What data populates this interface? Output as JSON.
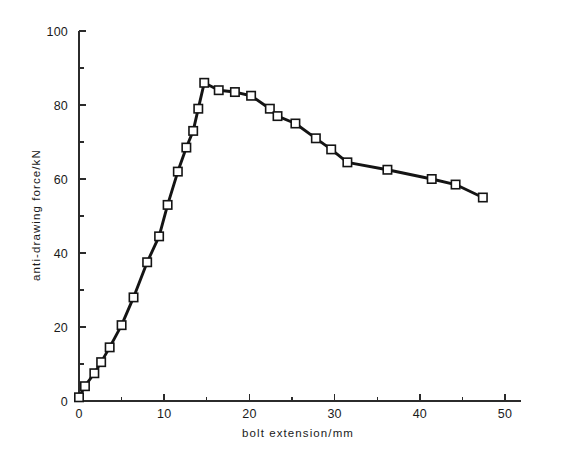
{
  "chart_data": {
    "type": "line",
    "title": "",
    "xlabel": "bolt extension/mm",
    "ylabel": "anti-drawing force/kN",
    "xlim": [
      0,
      52
    ],
    "ylim": [
      0,
      100
    ],
    "xticks": [
      0,
      10,
      20,
      30,
      40,
      50
    ],
    "yticks": [
      0,
      20,
      40,
      60,
      80,
      100
    ],
    "xtick_labels": [
      "0",
      "10",
      "20",
      "30",
      "40",
      "50"
    ],
    "ytick_labels": [
      "0",
      "20",
      "40",
      "60",
      "80",
      "100"
    ],
    "x_minor_interval": 5,
    "y_minor_interval": 10,
    "grid": false,
    "legend": false,
    "marker": "open-square",
    "series": [
      {
        "name": "anti-drawing force",
        "x": [
          0.0,
          0.7,
          1.8,
          2.6,
          3.6,
          5.0,
          6.4,
          8.0,
          9.4,
          10.4,
          11.6,
          12.6,
          13.4,
          14.0,
          14.7,
          16.4,
          18.3,
          20.2,
          22.4,
          23.3,
          25.4,
          27.8,
          29.6,
          31.5,
          36.2,
          41.4,
          44.2,
          47.4
        ],
        "y": [
          1.0,
          4.0,
          7.5,
          10.5,
          14.5,
          20.5,
          28.0,
          37.5,
          44.5,
          53.0,
          62.0,
          68.5,
          73.0,
          79.0,
          86.0,
          84.0,
          83.5,
          82.5,
          79.0,
          77.0,
          75.0,
          71.0,
          68.0,
          64.5,
          62.5,
          60.0,
          58.5,
          55.0
        ]
      }
    ]
  },
  "axes": {
    "x_axis_name": "bolt extension axis",
    "y_axis_name": "anti-drawing force axis"
  }
}
